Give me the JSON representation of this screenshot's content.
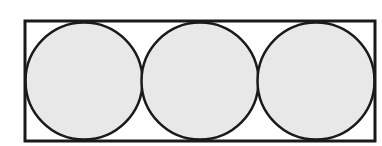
{
  "figure": {
    "background_color": "#ffffff",
    "canvas": {
      "width": 382,
      "height": 146
    }
  },
  "chart_data": {
    "type": "diagram",
    "rectangle": {
      "name": "bounding-rectangle",
      "x": 25,
      "y": 21,
      "width": 350,
      "height": 120,
      "stroke": "#1a1a1a",
      "stroke_width": 3,
      "fill": "#ffffff"
    },
    "circle_radius": 58.5,
    "circle_diameter": 117,
    "circle_stroke": "#1a1a1a",
    "circle_stroke_width": 2.5,
    "circle_fill": "#e8e8e8",
    "circles": [
      {
        "name": "circle-left",
        "cx": 84,
        "cy": 81,
        "r": 58.5
      },
      {
        "name": "circle-middle",
        "cx": 200,
        "cy": 81,
        "r": 58.5
      },
      {
        "name": "circle-right",
        "cx": 316,
        "cy": 81,
        "r": 58.5
      }
    ],
    "tangency_points_x": [
      141,
      258
    ],
    "xlim": [
      0,
      382
    ],
    "ylim": [
      0,
      146
    ],
    "grid": false,
    "legend": null,
    "labels": []
  }
}
